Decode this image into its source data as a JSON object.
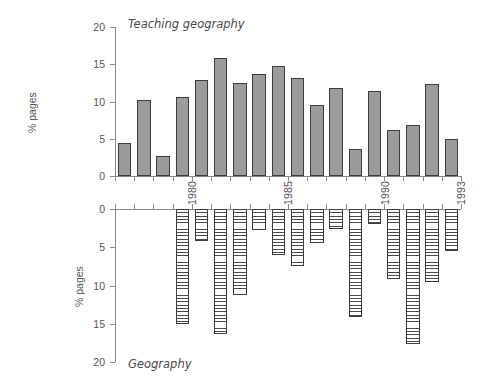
{
  "figure": {
    "background": "#ffffff",
    "bar_fill_top": "#9b9b9b",
    "bar_border": "#3c3c3c",
    "axis_color": "#8a8a8a",
    "text_color": "#555555"
  },
  "panels": {
    "top": {
      "caption": "Teaching geography",
      "y_axis_title": "% pages",
      "y_ticks": [
        "0",
        "5",
        "10",
        "15",
        "20"
      ],
      "x_labels": [
        "1980",
        "1985",
        "1990",
        "1993"
      ]
    },
    "bottom": {
      "caption": "Geography",
      "y_axis_title": "% pages",
      "y_ticks": [
        "0",
        "5",
        "10",
        "15",
        "20"
      ],
      "x_labels": [
        "1980",
        "1985",
        "1990",
        "1993"
      ]
    }
  },
  "chart_data": [
    {
      "type": "bar",
      "title": "Teaching geography",
      "xlabel": "",
      "ylabel": "% pages",
      "ylim": [
        0,
        20
      ],
      "direction": "up",
      "grid": false,
      "legend": "none",
      "categories": [
        "1977",
        "1978",
        "1979",
        "1980",
        "1981",
        "1982",
        "1983",
        "1984",
        "1985",
        "1986",
        "1987",
        "1988",
        "1989",
        "1990",
        "1991",
        "1992",
        "1993"
      ],
      "tick_labels_shown": [
        "1980",
        "1985",
        "1990",
        "1993"
      ],
      "values": [
        4.4,
        10.2,
        2.7,
        10.6,
        12.9,
        15.8,
        12.5,
        13.7,
        14.7,
        13.1,
        9.5,
        11.8,
        3.6,
        11.4,
        6.2,
        6.9,
        12.3
      ],
      "extra_value": 4.9,
      "note": "final bar 1993 = 4.9"
    },
    {
      "type": "bar",
      "title": "Geography",
      "xlabel": "",
      "ylabel": "% pages",
      "ylim": [
        0,
        20
      ],
      "direction": "down",
      "grid": false,
      "legend": "none",
      "categories": [
        "1977",
        "1978",
        "1979",
        "1980",
        "1981",
        "1982",
        "1983",
        "1984",
        "1985",
        "1986",
        "1987",
        "1988",
        "1989",
        "1990",
        "1991",
        "1992",
        "1993"
      ],
      "tick_labels_shown": [
        "1980",
        "1985",
        "1990",
        "1993"
      ],
      "values": [
        15.0,
        4.2,
        16.3,
        11.3,
        2.8,
        6.0,
        7.5,
        4.5,
        2.6,
        14.1,
        2.0,
        9.2,
        17.6,
        9.5,
        5.5
      ],
      "note": "bars drawn downward from zero line"
    }
  ],
  "top_bars": [
    {
      "label": "1977",
      "value": 4.4
    },
    {
      "label": "1978",
      "value": 10.2
    },
    {
      "label": "1979",
      "value": 2.7
    },
    {
      "label": "1980",
      "value": 10.6
    },
    {
      "label": "1981",
      "value": 12.9
    },
    {
      "label": "1982",
      "value": 15.8
    },
    {
      "label": "1983",
      "value": 12.5
    },
    {
      "label": "1984",
      "value": 13.7
    },
    {
      "label": "1985",
      "value": 14.7
    },
    {
      "label": "1986",
      "value": 13.1
    },
    {
      "label": "1987",
      "value": 9.5
    },
    {
      "label": "1988",
      "value": 11.8
    },
    {
      "label": "1989",
      "value": 3.6
    },
    {
      "label": "1990",
      "value": 11.4
    },
    {
      "label": "1991",
      "value": 6.2
    },
    {
      "label": "1992",
      "value": 6.9
    },
    {
      "label": "1993a",
      "value": 12.3
    },
    {
      "label": "1993",
      "value": 4.9
    }
  ],
  "bottom_bars": [
    {
      "label": "1980",
      "value": 15.0
    },
    {
      "label": "1981",
      "value": 4.2
    },
    {
      "label": "1982",
      "value": 16.3
    },
    {
      "label": "1983",
      "value": 11.3
    },
    {
      "label": "1984",
      "value": 2.8
    },
    {
      "label": "1985",
      "value": 6.0
    },
    {
      "label": "1986",
      "value": 7.5
    },
    {
      "label": "1987",
      "value": 4.5
    },
    {
      "label": "1988",
      "value": 2.6
    },
    {
      "label": "1989",
      "value": 14.1
    },
    {
      "label": "1990",
      "value": 2.0
    },
    {
      "label": "1991",
      "value": 9.2
    },
    {
      "label": "1992",
      "value": 17.6
    },
    {
      "label": "1993a",
      "value": 9.5
    },
    {
      "label": "1993",
      "value": 5.5
    }
  ]
}
